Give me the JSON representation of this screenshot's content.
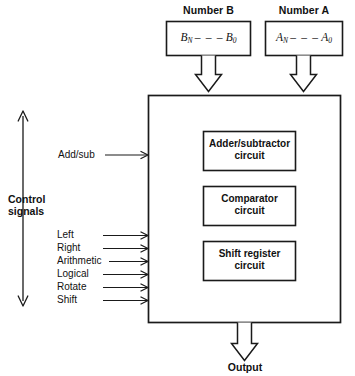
{
  "diagram": {
    "colors": {
      "stroke": "#1a1a1a",
      "fill": "#ffffff",
      "text": "#111111"
    },
    "inputs": [
      {
        "id": "number-b",
        "title": "Number B",
        "msb": "B",
        "msb_sub": "N",
        "dashes": "– – –",
        "lsb": "B",
        "lsb_sub": "0"
      },
      {
        "id": "number-a",
        "title": "Number A",
        "msb": "A",
        "msb_sub": "N",
        "dashes": "– – –",
        "lsb": "A",
        "lsb_sub": "0"
      }
    ],
    "main_block": {
      "units": [
        {
          "id": "adder-subtractor",
          "line1": "Adder/subtractor",
          "line2": "circuit"
        },
        {
          "id": "comparator",
          "line1": "Comparator",
          "line2": "circuit"
        },
        {
          "id": "shift-register",
          "line1": "Shift register",
          "line2": "circuit"
        }
      ]
    },
    "control": {
      "group_line1": "Control",
      "group_line2": "signals",
      "mode_signal": "Add/sub",
      "shift_signals": [
        "Left",
        "Right",
        "Arithmetic",
        "Logical",
        "Rotate",
        "Shift"
      ]
    },
    "output": {
      "label": "Output"
    }
  }
}
